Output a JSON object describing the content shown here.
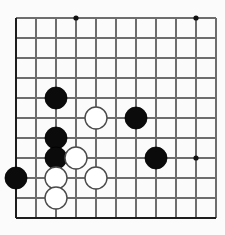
{
  "board": {
    "name": "go-board",
    "game": "Go",
    "background_color": "#fdfdfd",
    "line_color": "#6d6d6d",
    "edge_color": "#1d1d1d",
    "black_stone_color": "#0b0b0b",
    "white_stone_color": "#ffffff",
    "origin_x": 16,
    "origin_y": 18,
    "cell_size": 20,
    "columns": 11,
    "rows": 11,
    "stone_radius": 11,
    "star_radius": 2.6,
    "edges": {
      "left": true,
      "top": false,
      "right": false,
      "bottom": true
    },
    "star_points": [
      {
        "col": 3,
        "row": 0
      },
      {
        "col": 9,
        "row": 0
      },
      {
        "col": 9,
        "row": 7
      }
    ],
    "stones": [
      {
        "color": "black",
        "col": 2,
        "row": 4,
        "label": "black-stone-c2-r4"
      },
      {
        "color": "white",
        "col": 4,
        "row": 5,
        "label": "white-stone-c4-r5"
      },
      {
        "color": "black",
        "col": 6,
        "row": 5,
        "label": "black-stone-c6-r5"
      },
      {
        "color": "black",
        "col": 2,
        "row": 6,
        "label": "black-stone-c2-r6"
      },
      {
        "color": "black",
        "col": 2,
        "row": 7,
        "label": "black-stone-c2-r7"
      },
      {
        "color": "white",
        "col": 3,
        "row": 7,
        "label": "white-stone-c3-r7"
      },
      {
        "color": "black",
        "col": 7,
        "row": 7,
        "label": "black-stone-c7-r7"
      },
      {
        "color": "black",
        "col": 0,
        "row": 8,
        "label": "black-stone-c0-r8"
      },
      {
        "color": "white",
        "col": 2,
        "row": 8,
        "label": "white-stone-c2-r8"
      },
      {
        "color": "white",
        "col": 4,
        "row": 8,
        "label": "white-stone-c4-r8"
      },
      {
        "color": "white",
        "col": 2,
        "row": 9,
        "label": "white-stone-c2-r9"
      }
    ],
    "counts": {
      "black_stones": 6,
      "white_stones": 5,
      "total_stones": 11
    }
  }
}
